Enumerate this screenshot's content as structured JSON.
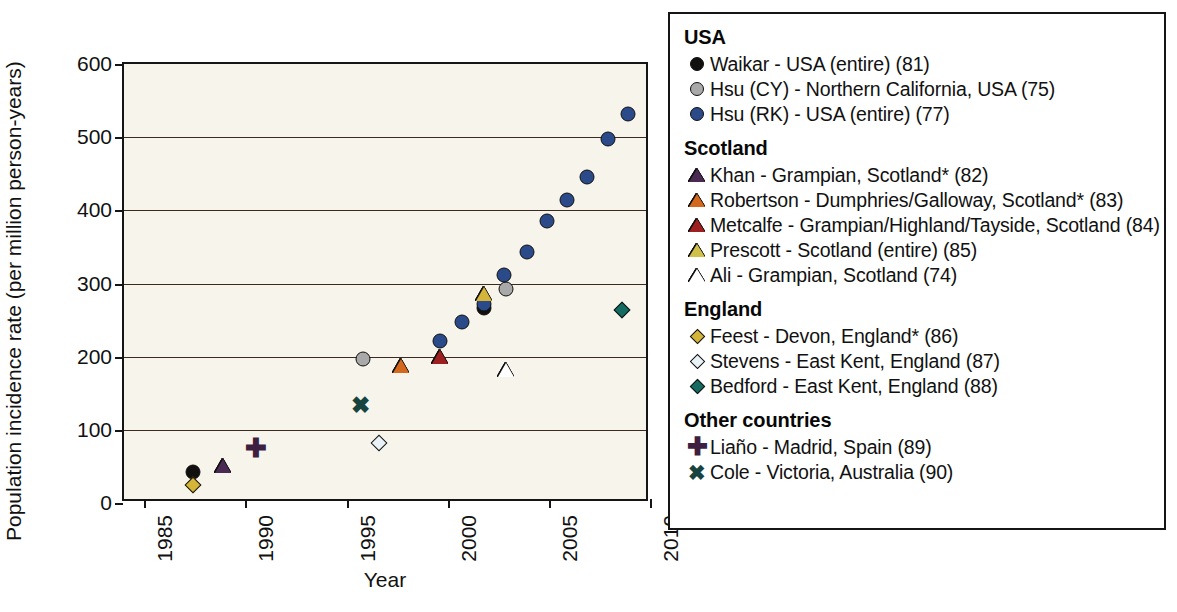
{
  "chart_data": {
    "type": "scatter",
    "title": "",
    "xlabel": "Year",
    "ylabel": "Population incidence rate (per million person-years)",
    "xlim": [
      1984,
      2010
    ],
    "ylim": [
      0,
      600
    ],
    "xticks": [
      "1985",
      "1990",
      "1995",
      "2000",
      "2005",
      "2010"
    ],
    "xtick_values": [
      1985,
      1990,
      1995,
      2000,
      2005,
      2010
    ],
    "yticks": [
      "0",
      "100",
      "200",
      "300",
      "400",
      "500",
      "600"
    ],
    "ytick_values": [
      0,
      100,
      200,
      300,
      400,
      500,
      600
    ],
    "grid": "horizontal",
    "legend_position": "right-outside",
    "plot_background": "#f7f4ec",
    "series": [
      {
        "name": "Waikar - USA (entire) (81)",
        "marker": "circle-filled",
        "color": "#12100e",
        "points": [
          {
            "x": 1987.4,
            "y": 43
          },
          {
            "x": 2001.8,
            "y": 267
          }
        ]
      },
      {
        "name": "Hsu (CY) - Northern California, USA (75)",
        "marker": "circle-filled",
        "color": "#a9a9a9",
        "points": [
          {
            "x": 1995.8,
            "y": 197
          },
          {
            "x": 2002.9,
            "y": 293
          }
        ]
      },
      {
        "name": "Hsu (RK) - USA (entire) (77)",
        "marker": "circle-filled",
        "color": "#2a4a8a",
        "points": [
          {
            "x": 1999.6,
            "y": 221
          },
          {
            "x": 2000.7,
            "y": 248
          },
          {
            "x": 2001.8,
            "y": 272
          },
          {
            "x": 2002.8,
            "y": 312
          },
          {
            "x": 2003.9,
            "y": 343
          },
          {
            "x": 2004.9,
            "y": 386
          },
          {
            "x": 2005.9,
            "y": 414
          },
          {
            "x": 2006.9,
            "y": 445
          },
          {
            "x": 2007.9,
            "y": 497
          },
          {
            "x": 2008.9,
            "y": 532
          }
        ]
      },
      {
        "name": "Khan - Grampian, Scotland* (82)",
        "marker": "triangle-filled",
        "color": "#4a2a52",
        "points": [
          {
            "x": 1988.9,
            "y": 50
          }
        ]
      },
      {
        "name": "Robertson - Dumphries/Galloway, Scotland* (83)",
        "marker": "triangle-filled",
        "color": "#d4691e",
        "points": [
          {
            "x": 1997.7,
            "y": 187
          }
        ]
      },
      {
        "name": "Metcalfe - Grampian/Highland/Tayside, Scotland (84)",
        "marker": "triangle-filled",
        "color": "#9e1f1f",
        "points": [
          {
            "x": 1999.6,
            "y": 200
          }
        ]
      },
      {
        "name": "Prescott - Scotland (entire) (85)",
        "marker": "triangle-filled",
        "color": "#d4b53a",
        "points": [
          {
            "x": 2001.8,
            "y": 285
          }
        ]
      },
      {
        "name": "Ali - Grampian, Scotland (74)",
        "marker": "triangle-open",
        "color": "#ffffff",
        "points": [
          {
            "x": 2002.9,
            "y": 182
          }
        ]
      },
      {
        "name": "Feest - Devon, England* (86)",
        "marker": "diamond-filled",
        "color": "#d4b53a",
        "points": [
          {
            "x": 1987.4,
            "y": 25
          }
        ]
      },
      {
        "name": "Stevens - East Kent, England (87)",
        "marker": "diamond-open",
        "color": "#e8f2f7",
        "points": [
          {
            "x": 1996.6,
            "y": 82
          }
        ]
      },
      {
        "name": "Bedford - East Kent, England (88)",
        "marker": "diamond-filled",
        "color": "#146b62",
        "points": [
          {
            "x": 2008.6,
            "y": 264
          }
        ]
      },
      {
        "name": "Liaño - Madrid, Spain (89)",
        "marker": "plus",
        "color": "#3d1f42",
        "points": [
          {
            "x": 1990.5,
            "y": 76
          }
        ]
      },
      {
        "name": "Cole - Victoria, Australia (90)",
        "marker": "cross",
        "color": "#17443f",
        "points": [
          {
            "x": 1995.7,
            "y": 133
          }
        ]
      }
    ]
  },
  "legend": {
    "groups": [
      {
        "heading": "USA",
        "items": [
          {
            "label": "Waikar - USA (entire) (81)",
            "marker": "circle-filled",
            "color": "#12100e"
          },
          {
            "label": "Hsu (CY) - Northern California, USA (75)",
            "marker": "circle-filled",
            "color": "#a9a9a9"
          },
          {
            "label": "Hsu (RK) - USA (entire) (77)",
            "marker": "circle-filled",
            "color": "#2a4a8a"
          }
        ]
      },
      {
        "heading": "Scotland",
        "items": [
          {
            "label": "Khan - Grampian, Scotland* (82)",
            "marker": "triangle-filled",
            "color": "#4a2a52"
          },
          {
            "label": "Robertson - Dumphries/Galloway, Scotland* (83)",
            "marker": "triangle-filled",
            "color": "#d4691e"
          },
          {
            "label": "Metcalfe - Grampian/Highland/Tayside, Scotland (84)",
            "marker": "triangle-filled",
            "color": "#9e1f1f"
          },
          {
            "label": "Prescott - Scotland (entire) (85)",
            "marker": "triangle-filled",
            "color": "#cfc04a"
          },
          {
            "label": "Ali - Grampian, Scotland (74)",
            "marker": "triangle-open",
            "color": "#ffffff"
          }
        ]
      },
      {
        "heading": "England",
        "items": [
          {
            "label": "Feest - Devon, England* (86)",
            "marker": "diamond-filled",
            "color": "#d4b53a"
          },
          {
            "label": "Stevens - East Kent, England (87)",
            "marker": "diamond-open",
            "color": "#e8f2f7"
          },
          {
            "label": "Bedford - East Kent, England (88)",
            "marker": "diamond-filled",
            "color": "#146b62"
          }
        ]
      },
      {
        "heading": "Other countries",
        "items": [
          {
            "label": "Liaño - Madrid, Spain (89)",
            "marker": "plus",
            "color": "#3d1f42"
          },
          {
            "label": "Cole - Victoria, Australia (90)",
            "marker": "cross",
            "color": "#17443f"
          }
        ]
      }
    ]
  }
}
